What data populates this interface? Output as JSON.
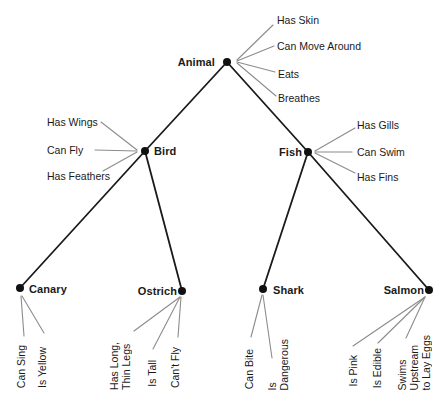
{
  "diagram": {
    "nodes": {
      "animal": {
        "label": "Animal",
        "properties": [
          "Has Skin",
          "Can Move Around",
          "Eats",
          "Breathes"
        ]
      },
      "bird": {
        "label": "Bird",
        "properties": [
          "Has Wings",
          "Can Fly",
          "Has Feathers"
        ]
      },
      "fish": {
        "label": "Fish",
        "properties": [
          "Has Gills",
          "Can Swim",
          "Has Fins"
        ]
      },
      "canary": {
        "label": "Canary",
        "properties": [
          "Can Sing",
          "Is Yellow"
        ]
      },
      "ostrich": {
        "label": "Ostrich",
        "properties": [
          "Has Long,\nThin Legs",
          "Is Tall",
          "Can't Fly"
        ]
      },
      "shark": {
        "label": "Shark",
        "properties": [
          "Can Bite",
          "Is\nDangerous"
        ]
      },
      "salmon": {
        "label": "Salmon",
        "properties": [
          "Is Pink",
          "Is Edible",
          "Swims\nUpstream\nto Lay Eggs"
        ]
      }
    },
    "edges": [
      {
        "from": "Animal",
        "to": "Bird"
      },
      {
        "from": "Animal",
        "to": "Fish"
      },
      {
        "from": "Bird",
        "to": "Canary"
      },
      {
        "from": "Bird",
        "to": "Ostrich"
      },
      {
        "from": "Fish",
        "to": "Shark"
      },
      {
        "from": "Fish",
        "to": "Salmon"
      }
    ],
    "colors": {
      "text": "#1a1a1a",
      "edge": "#1a1a1a",
      "property_line": "#8c8c8c",
      "node_dot": "#111111",
      "background": "#ffffff"
    }
  }
}
